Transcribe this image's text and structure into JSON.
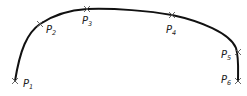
{
  "diagram": {
    "curve_color": "#111111",
    "marker_color": "#555555",
    "points": [
      {
        "id": "P1",
        "base": "P",
        "sub": "1",
        "x": 15,
        "y": 81,
        "lx": 23,
        "ly": 87
      },
      {
        "id": "P2",
        "base": "P",
        "sub": "2",
        "x": 40,
        "y": 24,
        "lx": 46,
        "ly": 33
      },
      {
        "id": "P3",
        "base": "P",
        "sub": "3",
        "x": 87,
        "y": 9,
        "lx": 82,
        "ly": 24
      },
      {
        "id": "P4",
        "base": "P",
        "sub": "4",
        "x": 172,
        "y": 15,
        "lx": 166,
        "ly": 33
      },
      {
        "id": "P5",
        "base": "P",
        "sub": "5",
        "x": 238,
        "y": 52,
        "lx": 221,
        "ly": 58
      },
      {
        "id": "P6",
        "base": "P",
        "sub": "6",
        "x": 238,
        "y": 81,
        "lx": 221,
        "ly": 83
      }
    ]
  }
}
